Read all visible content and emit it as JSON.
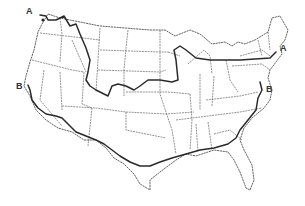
{
  "map": {
    "subject": "Contiguous United States outline map with state boundaries",
    "routes": [
      {
        "id": "A",
        "label_west": "A",
        "label_east": "A",
        "description": "Northern line from Washington coast across northern states to New England"
      },
      {
        "id": "B",
        "label_west": "B",
        "label_east": "B",
        "description": "Southern line from California coast across southern states to Mid-Atlantic coast"
      }
    ],
    "colors": {
      "lines": "#2a2a2a",
      "borders": "#666666",
      "background": "#ffffff"
    }
  }
}
